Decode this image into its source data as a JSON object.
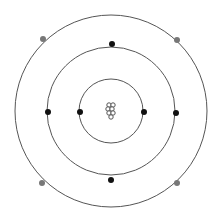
{
  "diagram": {
    "type": "bohr-atom-model",
    "center": [
      111,
      111
    ],
    "nucleus": {
      "particles": 7,
      "color": "#555555"
    },
    "shells": [
      {
        "radius": 32,
        "electrons": [
          [
            80,
            112
          ],
          [
            144,
            112
          ]
        ],
        "electron_color": "#111111"
      },
      {
        "radius": 64,
        "electrons": [
          [
            112,
            44
          ],
          [
            48,
            112
          ],
          [
            176,
            113
          ],
          [
            111,
            180
          ]
        ],
        "electron_color": "#111111"
      },
      {
        "radius": 96,
        "electrons": [
          [
            43,
            39
          ],
          [
            177,
            40
          ],
          [
            42,
            183
          ],
          [
            177,
            183
          ]
        ],
        "electron_color": "#777777"
      }
    ],
    "line_color": "#555555"
  }
}
